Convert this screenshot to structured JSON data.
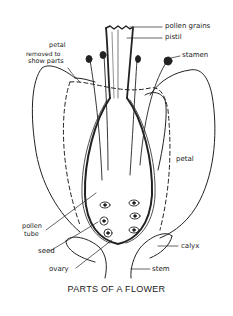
{
  "diagram": {
    "title": "PARTS OF A FLOWER",
    "labels": {
      "pollen_grains": "pollen grains",
      "pistil": "pistil",
      "petal_removed_line1": "petal",
      "petal_removed_line2": "removed to",
      "petal_removed_line3": "show parts",
      "stamen": "stamen",
      "petal": "petal",
      "pollen_tube_line1": "pollen",
      "pollen_tube_line2": "tube",
      "seed": "seed",
      "calyx": "calyx",
      "ovary": "ovary",
      "stem": "stem"
    },
    "colors": {
      "ink": "#222222",
      "background": "#ffffff"
    }
  }
}
